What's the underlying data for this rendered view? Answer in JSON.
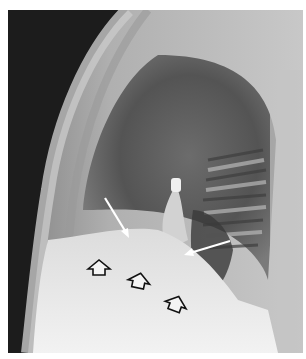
{
  "image": {
    "type": "radiograph",
    "view": "lateral chest X-ray",
    "annotations": {
      "white_arrows": [
        {
          "id": "arrow-1",
          "from": [
            97,
            6
          ],
          "to": [
            120,
            45
          ]
        },
        {
          "id": "arrow-2",
          "from": [
            222,
            52
          ],
          "to": [
            180,
            65
          ]
        }
      ],
      "outlined_arrows": [
        {
          "id": "open-arrow-1",
          "x": 88,
          "y": 72,
          "direction": "up"
        },
        {
          "id": "open-arrow-2",
          "x": 128,
          "y": 83,
          "direction": "up-right"
        },
        {
          "id": "open-arrow-3",
          "x": 165,
          "y": 107,
          "direction": "up-right"
        }
      ]
    },
    "colors": {
      "background": "#1a1a1a",
      "soft_tissue": "#8a8a8a",
      "lung": "#5e5e5e",
      "diaphragm": "#e6e6e6",
      "arrow_white": "#ffffff",
      "arrow_outline": "#111111"
    }
  }
}
